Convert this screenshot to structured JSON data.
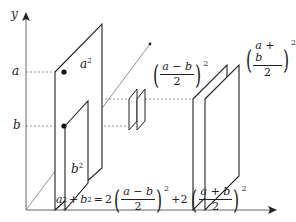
{
  "diagram": {
    "axes": {
      "y_label": "y",
      "tick_a": "a",
      "tick_b": "b"
    },
    "panels": {
      "a_squared": {
        "base": "a",
        "exp": "2"
      },
      "b_squared": {
        "base": "b",
        "exp": "2"
      },
      "half_diff_squared": {
        "numerator": "a − b",
        "denominator": "2",
        "exp": "2"
      },
      "half_sum_squared": {
        "numerator": "a + b",
        "denominator": "2",
        "exp": "2"
      }
    },
    "equation": {
      "lhs_a": "a",
      "lhs_a_exp": "2",
      "plus1": "+",
      "lhs_b": "b",
      "lhs_b_exp": "2",
      "equals": "=",
      "coef1": "2",
      "frac1_num": "a − b",
      "frac1_den": "2",
      "frac1_exp": "2",
      "plus2": "+2",
      "frac2_num": "a + b",
      "frac2_den": "2",
      "frac2_exp": "2"
    },
    "colors": {
      "stroke": "#222222",
      "axis": "#555555",
      "dashed": "#666666",
      "background": "#ffffff"
    }
  }
}
